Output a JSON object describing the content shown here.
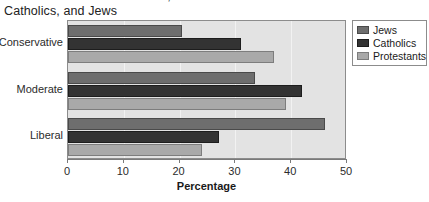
{
  "title": {
    "line1": "Political Views of Protestants,",
    "line2": "Catholics, and Jews"
  },
  "chart_data": {
    "type": "bar",
    "orientation": "horizontal",
    "title": "Political Views of Protestants, Catholics, and Jews",
    "categories": [
      "Conservative",
      "Moderate",
      "Liberal"
    ],
    "series": [
      {
        "name": "Jews",
        "color": "#6e6e6e",
        "values": [
          20.5,
          33.5,
          46
        ]
      },
      {
        "name": "Catholics",
        "color": "#333333",
        "values": [
          31,
          42,
          27
        ]
      },
      {
        "name": "Protestants",
        "color": "#a9a9a9",
        "values": [
          37,
          39,
          24
        ]
      }
    ],
    "xlabel": "Percentage",
    "ylabel": "",
    "xlim": [
      0,
      50
    ],
    "xticks": [
      0,
      10,
      20,
      30,
      40,
      50
    ],
    "grid": true,
    "legend_position": "right",
    "plot_background": "#e3e3e3"
  }
}
